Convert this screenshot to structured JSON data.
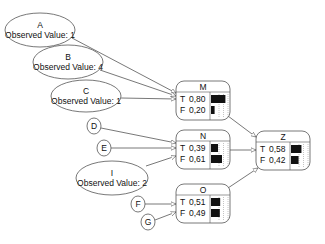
{
  "diagram": {
    "type": "bayesian-network",
    "evidence_nodes": [
      {
        "id": "A",
        "label": "A",
        "observed": "Observed Value: 1",
        "cx": 40,
        "cy": 30,
        "rx": 35,
        "ry": 17
      },
      {
        "id": "B",
        "label": "B",
        "observed": "Observed Value: 4",
        "cx": 68,
        "cy": 62,
        "rx": 35,
        "ry": 17
      },
      {
        "id": "C",
        "label": "C",
        "observed": "Observed Value: 1",
        "cx": 86,
        "cy": 96,
        "rx": 35,
        "ry": 16
      },
      {
        "id": "I",
        "label": "I",
        "observed": "Observed Value: 2",
        "cx": 112,
        "cy": 178,
        "rx": 36,
        "ry": 17
      }
    ],
    "simple_nodes": [
      {
        "id": "D",
        "label": "D",
        "cx": 94,
        "cy": 126,
        "rx": 7,
        "ry": 8
      },
      {
        "id": "E",
        "label": "E",
        "cx": 104,
        "cy": 148,
        "rx": 7,
        "ry": 8
      },
      {
        "id": "F",
        "label": "F",
        "cx": 138,
        "cy": 204,
        "rx": 7,
        "ry": 8
      },
      {
        "id": "G",
        "label": "G",
        "cx": 148,
        "cy": 222,
        "rx": 7,
        "ry": 8
      }
    ],
    "prob_nodes": [
      {
        "id": "M",
        "title": "M",
        "x": 176,
        "y": 81,
        "w": 54,
        "h": 39,
        "states": [
          {
            "label": "T",
            "value": "0,80",
            "p": 0.8
          },
          {
            "label": "F",
            "value": "0,20",
            "p": 0.2
          }
        ]
      },
      {
        "id": "N",
        "title": "N",
        "x": 176,
        "y": 130,
        "w": 54,
        "h": 39,
        "states": [
          {
            "label": "T",
            "value": "0,39",
            "p": 0.39
          },
          {
            "label": "F",
            "value": "0,61",
            "p": 0.61
          }
        ]
      },
      {
        "id": "Z",
        "title": "Z",
        "x": 256,
        "y": 131,
        "w": 54,
        "h": 39,
        "states": [
          {
            "label": "T",
            "value": "0,58",
            "p": 0.58
          },
          {
            "label": "F",
            "value": "0,42",
            "p": 0.42
          }
        ]
      },
      {
        "id": "O",
        "title": "O",
        "x": 176,
        "y": 184,
        "w": 54,
        "h": 39,
        "states": [
          {
            "label": "T",
            "value": "0,51",
            "p": 0.51
          },
          {
            "label": "F",
            "value": "0,49",
            "p": 0.49
          }
        ]
      }
    ],
    "edges": [
      {
        "from": "A",
        "to": "M",
        "x1": 72,
        "y1": 38,
        "x2": 176,
        "y2": 93
      },
      {
        "from": "B",
        "to": "M",
        "x1": 100,
        "y1": 70,
        "x2": 176,
        "y2": 96
      },
      {
        "from": "C",
        "to": "M",
        "x1": 121,
        "y1": 98,
        "x2": 176,
        "y2": 99
      },
      {
        "from": "D",
        "to": "N",
        "x1": 101,
        "y1": 128,
        "x2": 176,
        "y2": 143
      },
      {
        "from": "E",
        "to": "N",
        "x1": 111,
        "y1": 148,
        "x2": 176,
        "y2": 148
      },
      {
        "from": "I",
        "to": "N",
        "x1": 146,
        "y1": 166,
        "x2": 176,
        "y2": 156
      },
      {
        "from": "F",
        "to": "O",
        "x1": 145,
        "y1": 204,
        "x2": 176,
        "y2": 204
      },
      {
        "from": "G",
        "to": "O",
        "x1": 155,
        "y1": 220,
        "x2": 176,
        "y2": 212
      },
      {
        "from": "M",
        "to": "Z",
        "x1": 228,
        "y1": 116,
        "x2": 256,
        "y2": 137
      },
      {
        "from": "N",
        "to": "Z",
        "x1": 230,
        "y1": 150,
        "x2": 256,
        "y2": 150
      },
      {
        "from": "O",
        "to": "Z",
        "x1": 228,
        "y1": 188,
        "x2": 258,
        "y2": 168
      }
    ],
    "colors": {
      "stroke": "#555555",
      "bar": "#111111",
      "fill": "#ffffff"
    }
  }
}
